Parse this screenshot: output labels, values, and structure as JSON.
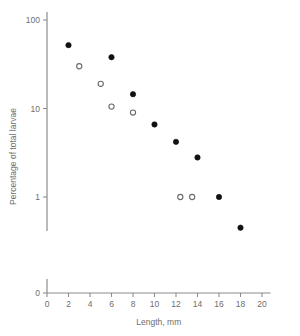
{
  "chart_data": {
    "type": "scatter",
    "title": "",
    "xlabel": "Length, mm",
    "ylabel": "Percentage of total larvae",
    "xlim": [
      0,
      20.8
    ],
    "ylim_log": [
      0.3,
      100
    ],
    "yscale": "log",
    "grid": false,
    "legend": "none",
    "x_ticks": [
      0,
      2,
      4,
      6,
      8,
      10,
      12,
      14,
      16,
      18,
      20
    ],
    "x_tick_labels": [
      "0",
      "2",
      "4",
      "6",
      "8",
      "10",
      "12",
      "14",
      "16",
      "18",
      "20"
    ],
    "y_ticks": [
      100,
      10,
      1,
      0
    ],
    "y_tick_labels": [
      "100",
      "10",
      "1",
      "0"
    ],
    "y_axis_broken_below": "1",
    "series": [
      {
        "name": "filled-circles",
        "marker": "filled circle",
        "color": "#111111",
        "points": [
          {
            "x": 2.0,
            "y": 52.0
          },
          {
            "x": 6.0,
            "y": 38.0
          },
          {
            "x": 8.0,
            "y": 14.5
          },
          {
            "x": 10.0,
            "y": 6.6
          },
          {
            "x": 12.0,
            "y": 4.2
          },
          {
            "x": 14.0,
            "y": 2.8
          },
          {
            "x": 16.0,
            "y": 1.0
          },
          {
            "x": 18.0,
            "y": 0.45
          }
        ]
      },
      {
        "name": "open-circles",
        "marker": "open circle",
        "color": "#6b6b6b",
        "points": [
          {
            "x": 3.0,
            "y": 30.0
          },
          {
            "x": 5.0,
            "y": 19.0
          },
          {
            "x": 6.0,
            "y": 10.5
          },
          {
            "x": 8.0,
            "y": 9.0
          },
          {
            "x": 12.4,
            "y": 1.0
          },
          {
            "x": 13.5,
            "y": 1.0
          }
        ]
      }
    ]
  }
}
